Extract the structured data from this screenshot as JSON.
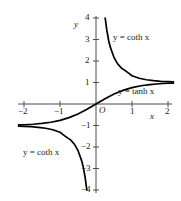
{
  "chart_data": {
    "type": "line",
    "title": "",
    "xlabel": "x",
    "ylabel": "y",
    "xlim": [
      -2.15,
      2.15
    ],
    "ylim": [
      -4.2,
      4.2
    ],
    "grid": false,
    "legend_position": "inline-annotations",
    "origin_label": "O",
    "xticks": [
      -2,
      -1,
      1,
      2
    ],
    "xtick_labels": [
      "−2",
      "−1",
      "1",
      "2"
    ],
    "yticks": [
      4,
      3,
      2,
      1,
      -1,
      -2,
      -3,
      -4
    ],
    "ytick_labels": [
      "4",
      "3",
      "2",
      "1",
      "−1",
      "−2",
      "−3",
      "−4"
    ],
    "curve_color": "#000000",
    "axis_color": "#4d4d4d",
    "series": [
      {
        "name": "y = tanh x",
        "label_text": "y = tanh x",
        "x": [
          -2.15,
          -2.0,
          -1.75,
          -1.5,
          -1.25,
          -1.0,
          -0.75,
          -0.5,
          -0.25,
          0,
          0.25,
          0.5,
          0.75,
          1.0,
          1.25,
          1.5,
          1.75,
          2.0,
          2.15
        ],
        "values": [
          -0.9734,
          -0.964,
          -0.9414,
          -0.9051,
          -0.8483,
          -0.7616,
          -0.6351,
          -0.4621,
          -0.2449,
          0,
          0.2449,
          0.4621,
          0.6351,
          0.7616,
          0.8483,
          0.9051,
          0.9414,
          0.964,
          0.9734
        ]
      },
      {
        "name": "y = coth x (positive branch)",
        "label_text": "y = coth x",
        "x": [
          0.2554,
          0.3,
          0.35,
          0.4,
          0.5,
          0.6,
          0.7,
          0.85,
          1.0,
          1.2,
          1.4,
          1.6,
          1.8,
          2.0,
          2.15
        ],
        "values": [
          4.0,
          3.4327,
          2.9659,
          2.6319,
          2.164,
          1.8687,
          1.6795,
          1.5085,
          1.313,
          1.1995,
          1.1293,
          1.0854,
          1.0556,
          1.0373,
          1.0273
        ]
      },
      {
        "name": "y = coth x (negative branch)",
        "label_text": "y = coth x",
        "x": [
          -2.15,
          -2.0,
          -1.8,
          -1.6,
          -1.4,
          -1.2,
          -1.0,
          -0.85,
          -0.7,
          -0.6,
          -0.5,
          -0.4,
          -0.35,
          -0.3,
          -0.2554
        ],
        "values": [
          -1.0273,
          -1.0373,
          -1.0556,
          -1.0854,
          -1.1293,
          -1.1995,
          -1.313,
          -1.5085,
          -1.6795,
          -1.8687,
          -2.164,
          -2.6319,
          -2.9659,
          -3.4327,
          -4.0
        ]
      }
    ],
    "annotations": [
      {
        "id": "coth-upper",
        "text": "y = coth x",
        "x": 0.48,
        "y": 3.15
      },
      {
        "id": "tanh-right",
        "text": "y = tanh x",
        "x": 0.62,
        "y": 0.58
      },
      {
        "id": "coth-lower",
        "text": "y = coth x",
        "x": -1.98,
        "y": -2.32
      }
    ]
  },
  "labels": {
    "y_axis": "y",
    "x_axis": "x",
    "origin": "O",
    "coth_upper": "y = coth x",
    "tanh_right": "y = tanh x",
    "coth_lower": "y = coth x",
    "tick_x_neg2": "−2",
    "tick_x_neg1": "−1",
    "tick_x_1": "1",
    "tick_x_2": "2",
    "tick_y_4": "4",
    "tick_y_3": "3",
    "tick_y_2": "2",
    "tick_y_1": "1",
    "tick_y_neg1": "−1",
    "tick_y_neg2": "−2",
    "tick_y_neg3": "−3",
    "tick_y_neg4": "−4"
  }
}
